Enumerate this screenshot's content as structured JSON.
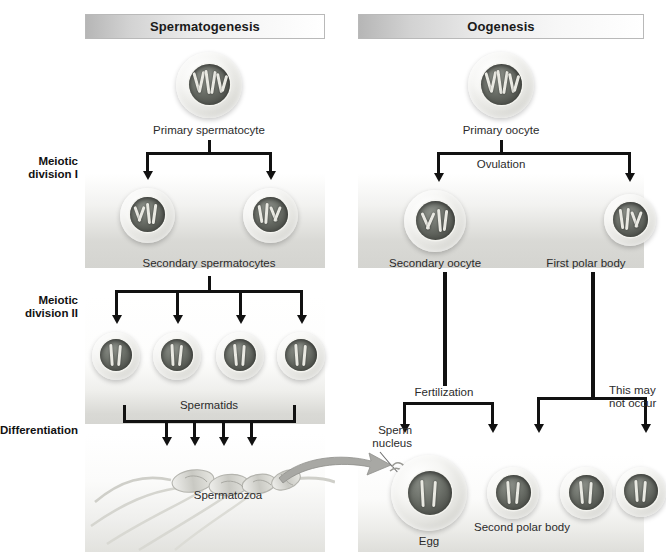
{
  "figure": {
    "type": "biology-diagram"
  },
  "headers": {
    "left": "Spermatogenesis",
    "right": "Oogenesis"
  },
  "stage_labels": [
    {
      "id": "meiotic-division-1",
      "line1": "Meiotic",
      "line2": "division I"
    },
    {
      "id": "meiotic-division-2",
      "line1": "Meiotic",
      "line2": "division II"
    },
    {
      "id": "differentiation",
      "line1": "Differentiation",
      "line2": ""
    }
  ],
  "spermatogenesis": {
    "primary": "Primary spermatocyte",
    "secondary": "Secondary spermatocytes",
    "spermatids": "Spermatids",
    "spermatozoa": "Spermatozoa"
  },
  "oogenesis": {
    "primary": "Primary oocyte",
    "ovulation": "Ovulation",
    "secondary_oocyte": "Secondary oocyte",
    "first_polar_body": "First polar body",
    "fertilization": "Fertilization",
    "sperm_nucleus_l1": "Sperm",
    "sperm_nucleus_l2": "nucleus",
    "may_not_occur_l1": "This may",
    "may_not_occur_l2": "not occur",
    "egg": "Egg",
    "second_polar_body": "Second polar body"
  },
  "colors": {
    "header_gradient_start": "#b6b6b6",
    "header_gradient_end": "#ffffff",
    "connector": "#111111",
    "band": "#d8d8d4",
    "nucleus": "#5a5d57",
    "chromosome": "#e9e9e2",
    "curved_arrow": "#9a9a9a",
    "text": "#2b2b2b"
  }
}
